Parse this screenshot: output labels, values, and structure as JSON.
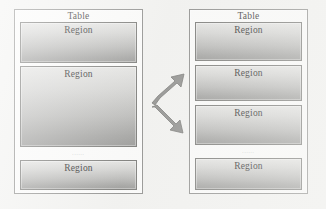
{
  "diagram": {
    "title_text": "Table",
    "region_text": "Region",
    "ellipsis_text": "......",
    "colors": {
      "page_background": "#f2f2f0",
      "table_fill": "#fbfbfa",
      "table_border": "#8a8a88",
      "region_border": "#72726f",
      "region_gradient_top": "#e3e3e1",
      "region_gradient_bottom": "#949492",
      "text": "#1d1d1d",
      "arrow_fill": "#8c8c8a",
      "arrow_stroke": "#6e6e6c"
    },
    "left_table": {
      "label": "Table",
      "regions": [
        {
          "label": "Region"
        },
        {
          "label": "Region"
        },
        {
          "label": "Region"
        }
      ],
      "ellipsis": "......"
    },
    "right_table": {
      "label": "Table",
      "regions": [
        {
          "label": "Region"
        },
        {
          "label": "Region"
        },
        {
          "label": "Region"
        },
        {
          "label": "Region"
        }
      ],
      "ellipsis": "......"
    },
    "arrows": [
      {
        "name": "split-arrow-up",
        "direction": "up-right"
      },
      {
        "name": "split-arrow-down",
        "direction": "down-right"
      }
    ]
  }
}
